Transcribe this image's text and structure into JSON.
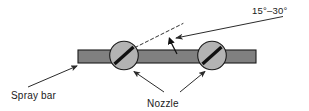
{
  "figure": {
    "background_color": "#ffffff"
  },
  "labels": {
    "angle": "15°–30°",
    "spray_bar": "Spray bar",
    "nozzle": "Nozzle"
  },
  "colors": {
    "bar_fill": "#808080",
    "bar_stroke": "#1a1a1a",
    "nozzle_fill": "#b3b3b3",
    "nozzle_stroke": "#1a1a1a",
    "slot_color": "#111111",
    "line_color": "#2b2b2b",
    "text_color": "#1a1a1a"
  },
  "geometry": {
    "bar": {
      "x": 78,
      "y": 50,
      "width": 178,
      "height": 13
    },
    "nozzles": [
      {
        "cx": 124,
        "cy": 55.5,
        "r": 14.5,
        "slot_angle_deg": -38
      },
      {
        "cx": 212,
        "cy": 55.5,
        "r": 14.5,
        "slot_angle_deg": -38
      }
    ],
    "dashed_reference_line": {
      "x1": 135,
      "y1": 47,
      "x2": 182,
      "y2": 24
    },
    "angle_arc_arrow": {
      "x1": 176,
      "y1": 53,
      "x2": 169,
      "y2": 37
    },
    "angle_leader_line": {
      "x1": 282,
      "y1": 17,
      "x2": 175,
      "y2": 38
    },
    "spray_bar_leader": {
      "x1": 28,
      "y1": 86,
      "x2": 76,
      "y2": 66
    },
    "nozzle_leaders": [
      {
        "x1": 163,
        "y1": 92,
        "x2": 134,
        "y2": 72
      },
      {
        "x1": 180,
        "y1": 92,
        "x2": 206,
        "y2": 72
      }
    ],
    "text_positions": {
      "angle": {
        "x": 252,
        "y": 14
      },
      "spray_bar": {
        "x": 11,
        "y": 99
      },
      "nozzle": {
        "x": 147,
        "y": 106
      }
    }
  }
}
